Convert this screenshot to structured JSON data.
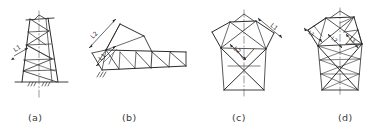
{
  "figure": {
    "background_color": "#ffffff",
    "line_color": "#2b2b2b",
    "label_color": "#262626",
    "caption_color": "#3a3a3a",
    "width": 381,
    "height": 131
  },
  "panels": [
    {
      "id": "a",
      "caption": "(a)",
      "type": "tapered-lattice-tower",
      "features": [
        "vertical-dash-dot-centerline",
        "horizontal-ground-line",
        "diagonal-web-bracing",
        "hatched-base-supports"
      ],
      "dimension_labels": [
        "L1"
      ]
    },
    {
      "id": "b",
      "caption": "(b)",
      "type": "inclined-end-panel-horizontal-truss",
      "features": [
        "rotated-left-end-panel",
        "horizontal-parallel-chord-truss",
        "diagonal-web-members",
        "hatched-support"
      ],
      "dimension_labels": [
        "L2",
        "L1"
      ]
    },
    {
      "id": "c",
      "caption": "(c)",
      "type": "crossed-arm-waisted-tower",
      "features": [
        "vertical-dash-dot-centerline",
        "wide-shoulder-arms",
        "x-bracing",
        "splayed-legs"
      ],
      "dimension_labels": [
        "L1",
        "L2"
      ]
    },
    {
      "id": "d",
      "caption": "(d)",
      "type": "dense-panelled-lattice-tower",
      "features": [
        "vertical-dash-dot-centerline",
        "multiple-triangular-panels",
        "x-bracing",
        "splayed-legs",
        "cantilever-arm"
      ],
      "dimension_labels": [
        "L1",
        "L2",
        "L3"
      ]
    }
  ],
  "captions": {
    "a": "(a)",
    "b": "(b)",
    "c": "(c)",
    "d": "(d)"
  },
  "labels": {
    "panel_a": {
      "l1": "L1"
    },
    "panel_b": {
      "l2": "L2",
      "l1": "L1"
    },
    "panel_c": {
      "l1": "L1",
      "l2": "L2"
    },
    "panel_d": {
      "l1": "L1",
      "l2": "L2",
      "l3": "L3"
    }
  }
}
